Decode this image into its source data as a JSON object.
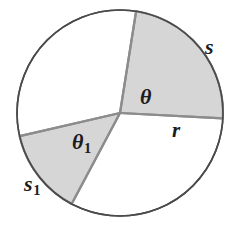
{
  "figure": {
    "kind": "circle-sector-diagram",
    "background_color": "#ffffff",
    "circle": {
      "cx": 120,
      "cy": 113,
      "r": 103,
      "stroke_color": "#4a4a4a",
      "stroke_width": 1.6,
      "fill_color": "#ffffff"
    },
    "sectors": [
      {
        "id": "sector-theta",
        "fill_color": "#d6d6d6",
        "stroke_color": "#8c8c8c",
        "stroke_width": 2.2,
        "start_angle_deg": -81,
        "end_angle_deg": 3,
        "arc_label": "s",
        "angle_label": "θ"
      },
      {
        "id": "sector-theta-1",
        "fill_color": "#d6d6d6",
        "stroke_color": "#8c8c8c",
        "stroke_width": 2.2,
        "start_angle_deg": 118,
        "end_angle_deg": 167,
        "arc_label": "s₁",
        "angle_label": "θ₁"
      }
    ],
    "radii": [
      {
        "id": "radius-upper-right",
        "angle_deg": -81,
        "label": null
      },
      {
        "id": "radius-right",
        "angle_deg": 3,
        "label": "r"
      },
      {
        "id": "radius-lower-left",
        "angle_deg": 118,
        "label": null
      },
      {
        "id": "radius-left",
        "angle_deg": 167,
        "label": null
      }
    ],
    "labels": [
      {
        "id": "label-s",
        "base": "s",
        "subscript": "",
        "x": 205,
        "y": 36,
        "font_size": 22
      },
      {
        "id": "label-r",
        "base": "r",
        "subscript": "",
        "x": 172,
        "y": 120,
        "font_size": 21
      },
      {
        "id": "label-theta",
        "base": "θ",
        "subscript": "",
        "x": 140,
        "y": 86,
        "font_size": 22
      },
      {
        "id": "label-theta-1",
        "base": "θ",
        "subscript": "1",
        "x": 72,
        "y": 131,
        "font_size": 22
      },
      {
        "id": "label-s-1",
        "base": "s",
        "subscript": "1",
        "x": 24,
        "y": 173,
        "font_size": 22
      }
    ],
    "label_text": {
      "arc_length_s": "s",
      "arc_length_s1_base": "s",
      "arc_length_s1_sub": "1",
      "radius_r": "r",
      "angle_theta": "θ",
      "angle_theta1_base": "θ",
      "angle_theta1_sub": "1"
    }
  }
}
